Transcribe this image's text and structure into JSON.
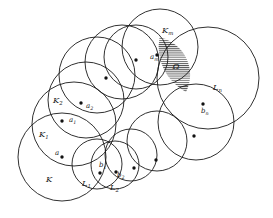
{
  "figure": {
    "background_color": "#ffffff",
    "stroke_color": "#1a1a1a",
    "dot_color": "#111111",
    "width": 273,
    "height": 218
  },
  "circles": [
    {
      "name": "K",
      "cx": 62,
      "cy": 157,
      "r": 44
    },
    {
      "name": "K1",
      "cx": 74,
      "cy": 124,
      "r": 42
    },
    {
      "name": "K2",
      "cx": 86,
      "cy": 100,
      "r": 38
    },
    {
      "name": "c4",
      "cx": 97,
      "cy": 75,
      "r": 38
    },
    {
      "name": "c5",
      "cx": 122,
      "cy": 62,
      "r": 37
    },
    {
      "name": "c6",
      "cx": 136,
      "cy": 57,
      "r": 32
    },
    {
      "name": "Km",
      "cx": 160,
      "cy": 47,
      "r": 38
    },
    {
      "name": "Ln",
      "cx": 208,
      "cy": 78,
      "r": 51
    },
    {
      "name": "cbn",
      "cx": 196,
      "cy": 122,
      "r": 38
    },
    {
      "name": "c10",
      "cx": 157,
      "cy": 141,
      "r": 30
    },
    {
      "name": "c11",
      "cx": 131,
      "cy": 155,
      "r": 26
    },
    {
      "name": "L2",
      "cx": 115,
      "cy": 165,
      "r": 24
    },
    {
      "name": "L1",
      "cx": 97,
      "cy": 164,
      "r": 25
    }
  ],
  "hatched_region": {
    "label": "Ω",
    "label_x": 176,
    "label_y": 69,
    "fill_color": "#ffffff",
    "hatch_color": "#2a2a2a",
    "hatch_orientation": "horizontal"
  },
  "set_labels": [
    {
      "id": "K",
      "base": "K",
      "sub": "",
      "x": 46,
      "y": 182
    },
    {
      "id": "K1",
      "base": "K",
      "sub": "1",
      "x": 39,
      "y": 137
    },
    {
      "id": "K2",
      "base": "K",
      "sub": "2",
      "x": 53,
      "y": 103
    },
    {
      "id": "Km",
      "base": "K",
      "sub": "m",
      "x": 162,
      "y": 33
    },
    {
      "id": "L1",
      "base": "L",
      "sub": "1",
      "x": 82,
      "y": 186
    },
    {
      "id": "L2",
      "base": "L",
      "sub": "2",
      "x": 110,
      "y": 190
    },
    {
      "id": "Ln",
      "base": "L",
      "sub": "n",
      "x": 213,
      "y": 90
    }
  ],
  "point_labels": [
    {
      "id": "a",
      "base": "a",
      "sub": "",
      "x": 55,
      "y": 155
    },
    {
      "id": "a1",
      "base": "a",
      "sub": "1",
      "x": 69,
      "y": 122
    },
    {
      "id": "a2",
      "base": "a",
      "sub": "2",
      "x": 86,
      "y": 108
    },
    {
      "id": "am",
      "base": "a",
      "sub": "m",
      "x": 150,
      "y": 59
    },
    {
      "id": "b1",
      "base": "b",
      "sub": "1",
      "x": 99,
      "y": 167
    },
    {
      "id": "b2",
      "base": "b",
      "sub": "2",
      "x": 117,
      "y": 177
    },
    {
      "id": "bn",
      "base": "b",
      "sub": "n",
      "x": 201,
      "y": 113
    }
  ],
  "center_dots": [
    {
      "id": "a",
      "cx": 62,
      "cy": 157,
      "r": 1.7
    },
    {
      "id": "a1",
      "cx": 62,
      "cy": 121,
      "r": 1.7
    },
    {
      "id": "a2",
      "cx": 81,
      "cy": 103,
      "r": 1.7
    },
    {
      "id": "d4",
      "cx": 106,
      "cy": 78,
      "r": 1.7
    },
    {
      "id": "d5",
      "cx": 136,
      "cy": 60,
      "r": 1.7
    },
    {
      "id": "am",
      "cx": 157,
      "cy": 55,
      "r": 1.7
    },
    {
      "id": "bn",
      "cx": 203,
      "cy": 104,
      "r": 1.7
    },
    {
      "id": "d8",
      "cx": 194,
      "cy": 136,
      "r": 1.7
    },
    {
      "id": "d9",
      "cx": 156,
      "cy": 160,
      "r": 1.7
    },
    {
      "id": "d10",
      "cx": 134,
      "cy": 168,
      "r": 1.7
    },
    {
      "id": "b2",
      "cx": 116,
      "cy": 172,
      "r": 1.7
    },
    {
      "id": "b1",
      "cx": 100,
      "cy": 173,
      "r": 1.7
    }
  ]
}
